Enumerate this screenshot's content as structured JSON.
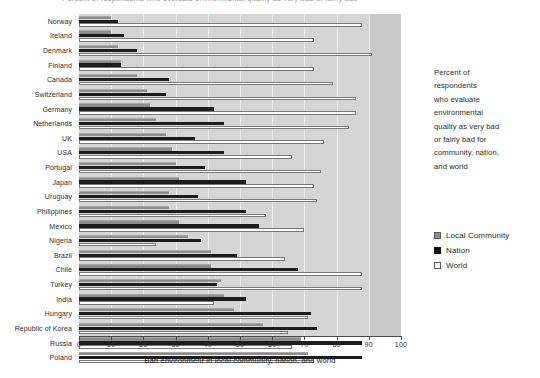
{
  "title": "Percent of respondents who evaluate environmental quality as very bad or fairly bad",
  "caption": {
    "lines": [
      "Percent of",
      "respondents",
      "who evaluate",
      "environmental",
      "quality as very bad",
      "or fairly bad for",
      "community, nation,",
      "and world"
    ]
  },
  "legend": {
    "position": "right",
    "items": [
      {
        "label": "Local Community",
        "color": "#8e8e8e",
        "swatch": "sw-community"
      },
      {
        "label": "Nation",
        "color": "#111111",
        "swatch": "sw-nation"
      },
      {
        "label": "World",
        "color": "#ffffff",
        "swatch": "sw-world"
      }
    ]
  },
  "axis": {
    "x_title": "Bad environment in local community, nation, and world",
    "ticks": [
      0,
      10,
      20,
      30,
      40,
      50,
      60,
      70,
      80,
      90,
      100
    ],
    "tick_labels": [
      "0",
      "10",
      "20",
      "30",
      "40",
      "50",
      "60",
      "70",
      "80",
      "90",
      "100"
    ]
  },
  "chart_data": {
    "type": "bar",
    "orientation": "horizontal",
    "title": "Percent of respondents who evaluate environmental quality as very bad or fairly bad",
    "xlabel": "Bad environment in local community, nation, and world",
    "ylabel": "",
    "xlim": [
      0,
      100
    ],
    "grid": true,
    "legend_position": "right",
    "categories": [
      "Norway",
      "Ireland",
      "Denmark",
      "Finland",
      "Canada",
      "Switzerland",
      "Germany",
      "Netherlands",
      "UK",
      "USA",
      "Portugal",
      "Japan",
      "Uruguay",
      "Philippines",
      "Mexico",
      "Nigeria",
      "Brazil",
      "Chile",
      "Turkey",
      "India",
      "Hungary",
      "Republic of Korea",
      "Russia",
      "Poland"
    ],
    "series": [
      {
        "name": "Local Community",
        "color": "#8e8e8e",
        "values": [
          10,
          10,
          12,
          13,
          18,
          21,
          22,
          24,
          27,
          29,
          30,
          31,
          28,
          28,
          31,
          34,
          41,
          41,
          44,
          45,
          48,
          57,
          69,
          71
        ]
      },
      {
        "name": "Nation",
        "color": "#111111",
        "values": [
          12,
          14,
          18,
          13,
          28,
          27,
          42,
          45,
          36,
          45,
          39,
          52,
          37,
          52,
          56,
          38,
          49,
          68,
          43,
          52,
          72,
          74,
          88,
          88
        ]
      },
      {
        "name": "World",
        "color": "#ffffff",
        "values": [
          88,
          73,
          91,
          73,
          79,
          86,
          86,
          84,
          76,
          66,
          75,
          73,
          74,
          58,
          70,
          24,
          64,
          88,
          88,
          42,
          71,
          65,
          66,
          73
        ]
      }
    ]
  }
}
